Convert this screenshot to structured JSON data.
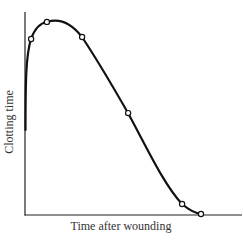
{
  "chart_data": {
    "type": "line",
    "title": "",
    "xlabel": "Time after wounding",
    "ylabel": "Clotting time",
    "xlim": [
      0,
      100
    ],
    "ylim": [
      0,
      100
    ],
    "grid": false,
    "legend": null,
    "ticks": {
      "x": [],
      "y": []
    },
    "series": [
      {
        "name": "Clotting time",
        "markers": "open-circle",
        "x": [
          2.8,
          10.1,
          26.3,
          47.5,
          72.4,
          81.1
        ],
        "y": [
          86.7,
          95.1,
          87.7,
          50.2,
          5.4,
          0.5
        ]
      }
    ],
    "annotations": [
      "Curve rises steeply from near-vertical start at y-axis (~42) to peak (~97) then falls to ~0"
    ]
  },
  "labels": {
    "x": "Time after wounding",
    "y": "Clotting time"
  },
  "style": {
    "line_color": "#111111",
    "axis_color": "#222222",
    "background": "#ffffff"
  }
}
